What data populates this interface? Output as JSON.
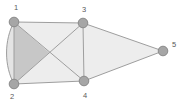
{
  "figure": {
    "kind": "undirected-graph-drawing",
    "background_color": "#ffffff",
    "width": 183,
    "height": 103,
    "node_fill": "#a6a6a6",
    "node_stroke": "#8c8c8c",
    "node_radius": 5,
    "edge_color": "#9e9e9e",
    "edge_width": 1,
    "label_color": "#595959",
    "face_fill_dark": "#c9c9c9",
    "face_fill_light": "#ececec",
    "face_fill_mid": "#e0e0e0"
  },
  "nodes": [
    {
      "id": "1",
      "label": "1",
      "x": 14,
      "y": 22,
      "label_x": 16,
      "label_y": 7
    },
    {
      "id": "2",
      "label": "2",
      "x": 14,
      "y": 84,
      "label_x": 12,
      "label_y": 97
    },
    {
      "id": "3",
      "label": "3",
      "x": 83,
      "y": 23,
      "label_x": 84,
      "label_y": 9
    },
    {
      "id": "4",
      "label": "4",
      "x": 84,
      "y": 81,
      "label_x": 85,
      "label_y": 96
    },
    {
      "id": "5",
      "label": "5",
      "x": 163,
      "y": 51,
      "label_x": 174,
      "label_y": 45
    }
  ],
  "edges": [
    {
      "from": "1",
      "to": "2",
      "style": "straight"
    },
    {
      "from": "1",
      "to": "2",
      "style": "curved-left"
    },
    {
      "from": "1",
      "to": "3",
      "style": "straight"
    },
    {
      "from": "1",
      "to": "4",
      "style": "straight"
    },
    {
      "from": "2",
      "to": "3",
      "style": "straight"
    },
    {
      "from": "2",
      "to": "4",
      "style": "straight"
    },
    {
      "from": "3",
      "to": "4",
      "style": "straight"
    },
    {
      "from": "3",
      "to": "5",
      "style": "straight"
    },
    {
      "from": "4",
      "to": "5",
      "style": "straight"
    }
  ],
  "faces": [
    {
      "name": "left-triangle",
      "shade": "dark",
      "points": "14,22 14,84 49,52"
    },
    {
      "name": "lens-1-2",
      "shade": "mid",
      "points": "14,22 14,84"
    },
    {
      "name": "top-triangle",
      "shade": "light",
      "points": "14,22 83,23 49,52"
    },
    {
      "name": "bottom-triangle",
      "shade": "light",
      "points": "14,84 84,81 49,52"
    },
    {
      "name": "right-triangle",
      "shade": "light",
      "points": "83,23 84,81 49,52"
    },
    {
      "name": "outer-triangle",
      "shade": "light",
      "points": "83,23 163,51 84,81"
    }
  ]
}
